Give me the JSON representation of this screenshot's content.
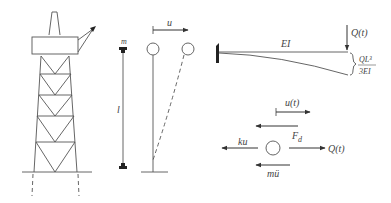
{
  "figure": {
    "panels": [
      {
        "id": "platform",
        "description": "Offshore jacket platform structure"
      },
      {
        "id": "stick-model",
        "description": "Lumped mass on massless column"
      },
      {
        "id": "deflected-model",
        "description": "Column with tip displacement"
      },
      {
        "id": "cantilever",
        "description": "Cantilever beam with tip load"
      },
      {
        "id": "free-body",
        "description": "Free body diagram of mass"
      }
    ],
    "labels": {
      "mass": "m",
      "length": "l",
      "displacement": "u",
      "stiffness": "EI",
      "load": "Q(t)",
      "deflection_num": "QL³",
      "deflection_den": "3EI",
      "disp_time": "u(t)",
      "damping_force": "F",
      "damping_sub": "d",
      "spring_force": "ku",
      "inertia_force": "mü",
      "applied_force": "Q(t)"
    },
    "colors": {
      "line": "#555555",
      "text": "#444444",
      "fill_dark": "#222222"
    }
  }
}
